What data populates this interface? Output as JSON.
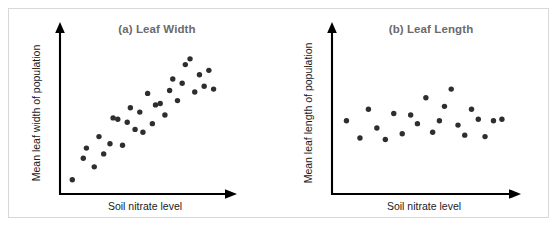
{
  "figure": {
    "background_color": "#ffffff",
    "frame_color": "#d8d8d8",
    "point_color": "#2e2e2e",
    "axis_color": "#000000",
    "title_color": "#6b6b6b",
    "label_color": "#1a1a1a"
  },
  "chart_data": [
    {
      "type": "scatter",
      "panel": "a",
      "title": "(a) Leaf Width",
      "xlabel": "Soil nitrate level",
      "ylabel": "Mean leaf width of population",
      "grid": false,
      "legend": "none",
      "xlim": [
        0,
        100
      ],
      "ylim": [
        0,
        100
      ],
      "relationship": "positive linear correlation",
      "x": [
        4,
        11,
        13,
        18,
        21,
        24,
        28,
        30,
        33,
        36,
        39,
        41,
        44,
        47,
        49,
        52,
        55,
        57,
        60,
        63,
        66,
        68,
        71,
        74,
        76,
        79,
        82,
        85,
        88,
        91,
        94
      ],
      "y": [
        5,
        20,
        27,
        14,
        35,
        23,
        30,
        48,
        47,
        29,
        45,
        55,
        40,
        52,
        38,
        65,
        44,
        57,
        58,
        50,
        67,
        75,
        60,
        72,
        85,
        89,
        66,
        78,
        70,
        81,
        68
      ]
    },
    {
      "type": "scatter",
      "panel": "b",
      "title": "(b) Leaf Length",
      "xlabel": "Soil nitrate level",
      "ylabel": "Mean leaf length of population",
      "grid": false,
      "legend": "none",
      "xlim": [
        0,
        100
      ],
      "ylim": [
        0,
        100
      ],
      "relationship": "no correlation",
      "x": [
        5,
        13,
        18,
        23,
        28,
        33,
        38,
        43,
        47,
        52,
        56,
        60,
        63,
        67,
        71,
        75,
        79,
        83,
        87,
        92,
        97
      ],
      "y": [
        46,
        34,
        54,
        41,
        33,
        51,
        37,
        50,
        44,
        62,
        38,
        46,
        56,
        68,
        43,
        36,
        54,
        47,
        35,
        46,
        47
      ]
    }
  ]
}
